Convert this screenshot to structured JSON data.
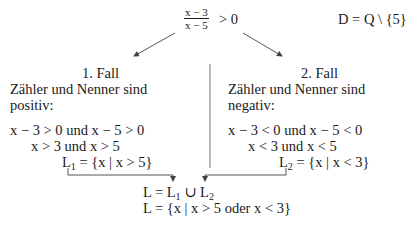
{
  "header": {
    "fraction_numerator": "x − 3",
    "fraction_denominator": "x − 5",
    "inequality": "> 0",
    "domain": "D = Q \\ {5}"
  },
  "case1": {
    "title": "1. Fall",
    "line1": "Zähler und Nenner sind",
    "line2": "positiv:",
    "cond1": "x − 3 > 0 und x − 5 > 0",
    "cond2": "x > 3 und x > 5",
    "solution_prefix": "L",
    "solution_sub": "1",
    "solution_rest": " = {x | x > 5}"
  },
  "case2": {
    "title": "2. Fall",
    "line1": "Zähler und Nenner sind",
    "line2": "negativ:",
    "cond1": "x − 3 < 0 und x − 5 < 0",
    "cond2": "x < 3 und x < 5",
    "solution_prefix": "L",
    "solution_sub": "2",
    "solution_rest": " = {x | x < 3}"
  },
  "result": {
    "union_a": "L = L",
    "union_sub1": "1",
    "union_mid": " ∪ L",
    "union_sub2": "2",
    "final": "L = {x | x > 5 oder x < 3}"
  },
  "colors": {
    "text": "#1a1a1a",
    "lines": "#555555"
  }
}
